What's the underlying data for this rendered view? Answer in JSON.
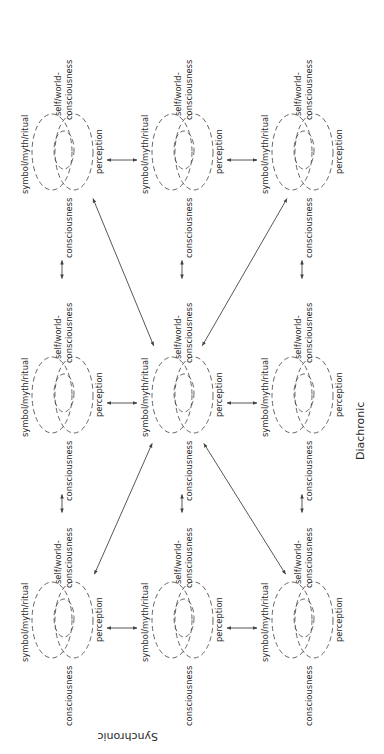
{
  "diagram": {
    "orientation": "rotated 90 degrees clockwise",
    "axis_labels": {
      "horizontal": "Diachronic",
      "vertical": "Synchronic"
    },
    "cluster_labels": {
      "symbol": "symbol/myth/ritual",
      "self_world_1": "self/world-",
      "self_world_2": "consciousness",
      "perception": "perception",
      "consciousness": "consciousness"
    },
    "grid": {
      "rows": 3,
      "cols": 3
    },
    "clusters": [
      {
        "id": "r0c0",
        "row": 0,
        "col": 0
      },
      {
        "id": "r0c1",
        "row": 0,
        "col": 1
      },
      {
        "id": "r0c2",
        "row": 0,
        "col": 2
      },
      {
        "id": "r1c0",
        "row": 1,
        "col": 0
      },
      {
        "id": "r1c1",
        "row": 1,
        "col": 1,
        "center": true
      },
      {
        "id": "r1c2",
        "row": 1,
        "col": 2
      },
      {
        "id": "r2c0",
        "row": 2,
        "col": 0
      },
      {
        "id": "r2c1",
        "row": 2,
        "col": 1
      },
      {
        "id": "r2c2",
        "row": 2,
        "col": 2
      }
    ],
    "connections": {
      "adjacent_double_arrows": [
        [
          "r0c0",
          "r0c1"
        ],
        [
          "r0c1",
          "r0c2"
        ],
        [
          "r1c0",
          "r1c1"
        ],
        [
          "r1c1",
          "r1c2"
        ],
        [
          "r2c0",
          "r2c1"
        ],
        [
          "r2c1",
          "r2c2"
        ],
        [
          "r0c0",
          "r1c0"
        ],
        [
          "r1c0",
          "r2c0"
        ],
        [
          "r0c1",
          "r1c1"
        ],
        [
          "r1c1",
          "r2c1"
        ],
        [
          "r0c2",
          "r1c2"
        ],
        [
          "r1c2",
          "r2c2"
        ]
      ],
      "diagonal_double_arrows": [
        [
          "r0c0",
          "r1c1"
        ],
        [
          "r0c2",
          "r1c1"
        ],
        [
          "r2c0",
          "r1c1"
        ],
        [
          "r2c2",
          "r1c1"
        ]
      ]
    }
  }
}
